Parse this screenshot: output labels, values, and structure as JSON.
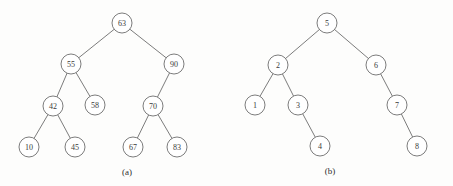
{
  "figure": {
    "background_color": "#fdfdfc",
    "stroke_color": "#6d6d6d",
    "text_color": "#3a3a3a",
    "node_radius": 10,
    "subfigures": [
      {
        "caption": "(a)",
        "caption_x": 127,
        "caption_y": 172,
        "nodes": [
          {
            "id": "a63",
            "label": "63",
            "cx": 122,
            "cy": 23
          },
          {
            "id": "a55",
            "label": "55",
            "cx": 71,
            "cy": 64
          },
          {
            "id": "a90",
            "label": "90",
            "cx": 174,
            "cy": 64
          },
          {
            "id": "a42",
            "label": "42",
            "cx": 53,
            "cy": 106
          },
          {
            "id": "a58",
            "label": "58",
            "cx": 95,
            "cy": 105
          },
          {
            "id": "a70",
            "label": "70",
            "cx": 153,
            "cy": 106
          },
          {
            "id": "a10",
            "label": "10",
            "cx": 29,
            "cy": 147
          },
          {
            "id": "a45",
            "label": "45",
            "cx": 75,
            "cy": 147
          },
          {
            "id": "a67",
            "label": "67",
            "cx": 133,
            "cy": 147
          },
          {
            "id": "a83",
            "label": "83",
            "cx": 177,
            "cy": 147
          }
        ],
        "edges": [
          {
            "from": "a63",
            "to": "a55"
          },
          {
            "from": "a63",
            "to": "a90"
          },
          {
            "from": "a55",
            "to": "a42"
          },
          {
            "from": "a55",
            "to": "a58"
          },
          {
            "from": "a42",
            "to": "a10"
          },
          {
            "from": "a42",
            "to": "a45"
          },
          {
            "from": "a90",
            "to": "a70"
          },
          {
            "from": "a70",
            "to": "a67"
          },
          {
            "from": "a70",
            "to": "a83"
          }
        ]
      },
      {
        "caption": "(b)",
        "caption_x": 330,
        "caption_y": 171,
        "nodes": [
          {
            "id": "b5",
            "label": "5",
            "cx": 327,
            "cy": 23
          },
          {
            "id": "b2",
            "label": "2",
            "cx": 278,
            "cy": 65
          },
          {
            "id": "b6",
            "label": "6",
            "cx": 376,
            "cy": 65
          },
          {
            "id": "b1",
            "label": "1",
            "cx": 255,
            "cy": 105
          },
          {
            "id": "b3",
            "label": "3",
            "cx": 298,
            "cy": 105
          },
          {
            "id": "b7",
            "label": "7",
            "cx": 397,
            "cy": 105
          },
          {
            "id": "b4",
            "label": "4",
            "cx": 320,
            "cy": 146
          },
          {
            "id": "b8",
            "label": "8",
            "cx": 417,
            "cy": 146
          }
        ],
        "edges": [
          {
            "from": "b5",
            "to": "b2"
          },
          {
            "from": "b5",
            "to": "b6"
          },
          {
            "from": "b2",
            "to": "b1"
          },
          {
            "from": "b2",
            "to": "b3"
          },
          {
            "from": "b3",
            "to": "b4"
          },
          {
            "from": "b6",
            "to": "b7"
          },
          {
            "from": "b7",
            "to": "b8"
          }
        ]
      }
    ]
  }
}
